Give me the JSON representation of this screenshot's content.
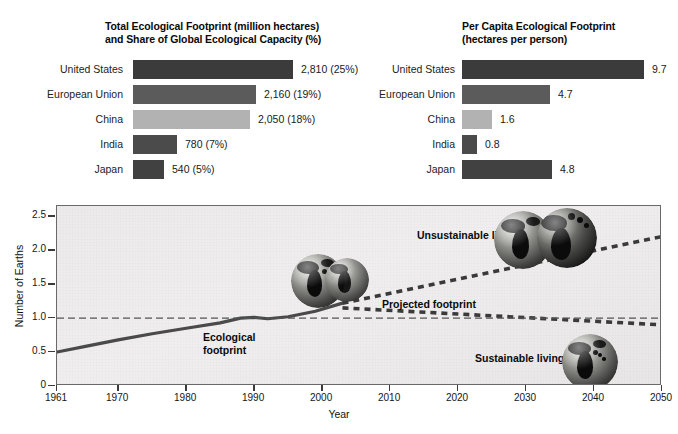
{
  "figure": {
    "background": "#ffffff",
    "plot_background": "#edebeb",
    "plot_border": "#6a6a6a"
  },
  "panels": {
    "left": {
      "title": "Total Ecological Footprint (million hectares)\nand Share of Global Ecological Capacity (%)",
      "rows": [
        {
          "label": "United States",
          "value_text": "2,810 (25%)",
          "value": 2810,
          "share_pct": 25,
          "color": "#3b3b3b"
        },
        {
          "label": "European Union",
          "value_text": "2,160 (19%)",
          "value": 2160,
          "share_pct": 19,
          "color": "#5b5b5b"
        },
        {
          "label": "China",
          "value_text": "2,050 (18%)",
          "value": 2050,
          "share_pct": 18,
          "color": "#b2b2b2"
        },
        {
          "label": "India",
          "value_text": "780 (7%)",
          "value": 780,
          "share_pct": 7,
          "color": "#4b4b4b"
        },
        {
          "label": "Japan",
          "value_text": "540 (5%)",
          "value": 540,
          "share_pct": 5,
          "color": "#414141"
        }
      ]
    },
    "right": {
      "title": "Per Capita Ecological Footprint\n(hectares per person)",
      "rows": [
        {
          "label": "United States",
          "value_text": "9.7",
          "value": 9.7,
          "color": "#3b3b3b"
        },
        {
          "label": "European Union",
          "value_text": "4.7",
          "value": 4.7,
          "color": "#5b5b5b"
        },
        {
          "label": "China",
          "value_text": "1.6",
          "value": 1.6,
          "color": "#b2b2b2"
        },
        {
          "label": "India",
          "value_text": "0.8",
          "value": 0.8,
          "color": "#4b4b4b"
        },
        {
          "label": "Japan",
          "value_text": "4.8",
          "value": 4.8,
          "color": "#414141"
        }
      ]
    }
  },
  "linechart": {
    "ylabel": "Number of Earths",
    "xlabel": "Year",
    "yticks": [
      "0",
      "0.5",
      "1.0",
      "1.5",
      "2.0",
      "2.5"
    ],
    "xticks": [
      "1961",
      "1970",
      "1980",
      "1990",
      "2000",
      "2010",
      "2020",
      "2030",
      "2040",
      "2050"
    ],
    "annotations": {
      "ecological_footprint": "Ecological\nfootprint",
      "projected_footprint": "Projected footprint",
      "unsustainable_living": "Unsustainable living",
      "sustainable_living": "Sustainable living"
    }
  },
  "chart_data": {
    "type": "line",
    "title": "",
    "xlabel": "Year",
    "ylabel": "Number of Earths",
    "xlim": [
      1961,
      2050
    ],
    "ylim": [
      0,
      2.65
    ],
    "yticks": [
      0,
      0.5,
      1.0,
      1.5,
      2.0,
      2.5
    ],
    "xticks": [
      1961,
      1970,
      1980,
      1990,
      2000,
      2010,
      2020,
      2030,
      2040,
      2050
    ],
    "grid": false,
    "legend": "none",
    "series": [
      {
        "name": "Ecological footprint",
        "style": "solid",
        "color": "#4a4a4a",
        "x": [
          1961,
          1965,
          1970,
          1975,
          1980,
          1985,
          1988,
          1990,
          1992,
          1995,
          1999,
          2003
        ],
        "values": [
          0.5,
          0.58,
          0.68,
          0.77,
          0.85,
          0.93,
          1.0,
          1.01,
          0.99,
          1.02,
          1.1,
          1.22
        ]
      },
      {
        "name": "Projected footprint – unsustainable living",
        "style": "dashed",
        "color": "#3a3a3a",
        "x": [
          2003,
          2050
        ],
        "values": [
          1.22,
          2.2
        ]
      },
      {
        "name": "Projected footprint – sustainable living",
        "style": "dashed",
        "color": "#3a3a3a",
        "x": [
          2003,
          2050
        ],
        "values": [
          1.15,
          0.9
        ]
      },
      {
        "name": "Earth's biological capacity (1.0 Earth)",
        "style": "dashed-thin",
        "color": "#555555",
        "x": [
          1961,
          2050
        ],
        "values": [
          1.0,
          1.0
        ]
      }
    ],
    "images": [
      {
        "name": "single-earth",
        "at_x": 2004,
        "at_y": 1.55,
        "meaning": "one earth footprint"
      },
      {
        "name": "double-earth",
        "at_x": 2046,
        "at_y": 2.25,
        "meaning": "more than one earth required"
      },
      {
        "name": "single-earth-sustainable",
        "at_x": 2044,
        "at_y": 0.72,
        "meaning": "within one earth"
      }
    ]
  },
  "bar_chart_data": [
    {
      "type": "bar",
      "orientation": "horizontal",
      "title": "Total Ecological Footprint (million hectares) and Share of Global Ecological Capacity (%)",
      "categories": [
        "United States",
        "European Union",
        "China",
        "India",
        "Japan"
      ],
      "values": [
        2810,
        2160,
        2050,
        780,
        540
      ],
      "share_pct": [
        25,
        19,
        18,
        7,
        5
      ],
      "xlabel": "million hectares",
      "ylabel": ""
    },
    {
      "type": "bar",
      "orientation": "horizontal",
      "title": "Per Capita Ecological Footprint (hectares per person)",
      "categories": [
        "United States",
        "European Union",
        "China",
        "India",
        "Japan"
      ],
      "values": [
        9.7,
        4.7,
        1.6,
        0.8,
        4.8
      ],
      "xlabel": "hectares per person",
      "ylabel": ""
    }
  ]
}
